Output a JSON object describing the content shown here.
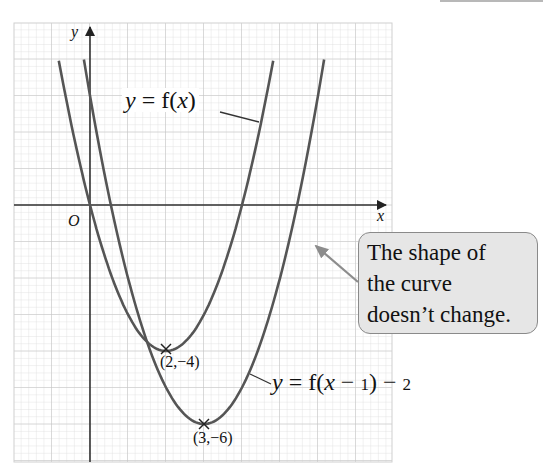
{
  "chart_data": {
    "type": "line",
    "title": "",
    "xlabel": "x",
    "ylabel": "y",
    "origin_label": "O",
    "grid": true,
    "xlim": [
      -2.0,
      7.95
    ],
    "ylim": [
      -7.0,
      5.0
    ],
    "series": [
      {
        "name": "y = f(x)",
        "equation": "y = (x - 2)^2 - 4",
        "vertex": [
          2,
          -4
        ],
        "x_intercepts": [
          0,
          4
        ],
        "x_range": [
          -0.82,
          4.82
        ]
      },
      {
        "name": "y = f(x - 1) - 2",
        "equation": "y = (x - 3)^2 - 6",
        "vertex": [
          3,
          -6
        ],
        "x_range": [
          -0.16,
          6.16
        ]
      }
    ],
    "annotations": [
      {
        "text": "(2,−4)",
        "point": [
          2,
          -4
        ],
        "marker": "x"
      },
      {
        "text": "(3,−6)",
        "point": [
          3,
          -6
        ],
        "marker": "x"
      },
      {
        "text": "The shape of the curve doesn’t change.",
        "type": "callout"
      }
    ]
  },
  "labels": {
    "f_prefix": "y",
    "f_eq": " = f(",
    "f_var": "x",
    "f_close": ")",
    "g_prefix": "y",
    "g_eq": " = f(",
    "g_var": "x",
    "g_minus1": " − ",
    "g_one": "1",
    "g_close": ") − ",
    "g_two": "2",
    "point1": "(2,−4)",
    "point2": "(3,−6)",
    "x_axis": "x",
    "y_axis": "y",
    "origin": "O"
  },
  "callout": {
    "line1": "The shape of",
    "line2": "the curve",
    "line3": "doesn’t change."
  },
  "colors": {
    "curve": "#555555",
    "axis": "#333333",
    "grid_minor": "#d9d9d9",
    "grid_major": "#bdbdbd",
    "callout_bg": "#e6e6e6",
    "callout_border": "#8a8a8a",
    "arrow": "#8c8c8c"
  }
}
